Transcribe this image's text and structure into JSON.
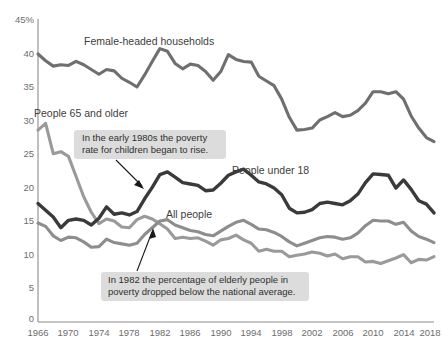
{
  "chart_data": {
    "type": "line",
    "title": "",
    "xlabel": "",
    "ylabel": "",
    "xlim": [
      1966,
      2018
    ],
    "ylim": [
      0,
      45
    ],
    "grid": false,
    "legend_position": "inline-labels",
    "y_tick_labels": [
      "45%",
      "40",
      "35",
      "30",
      "25",
      "20",
      "15",
      "10",
      "5",
      "0"
    ],
    "y_ticks": [
      45,
      40,
      35,
      30,
      25,
      20,
      15,
      10,
      5,
      0
    ],
    "x_tick_labels": [
      "1966",
      "1970",
      "1974",
      "1978",
      "1982",
      "1986",
      "1990",
      "1994",
      "1998",
      "2002",
      "2006",
      "2010",
      "2014",
      "2018"
    ],
    "x_ticks": [
      1966,
      1970,
      1974,
      1978,
      1982,
      1986,
      1990,
      1994,
      1998,
      2002,
      2006,
      2010,
      2014,
      2018
    ],
    "x": [
      1966,
      1967,
      1968,
      1969,
      1970,
      1971,
      1972,
      1973,
      1974,
      1975,
      1976,
      1977,
      1978,
      1979,
      1980,
      1981,
      1982,
      1983,
      1984,
      1985,
      1986,
      1987,
      1988,
      1989,
      1990,
      1991,
      1992,
      1993,
      1994,
      1995,
      1996,
      1997,
      1998,
      1999,
      2000,
      2001,
      2002,
      2003,
      2004,
      2005,
      2006,
      2007,
      2008,
      2009,
      2010,
      2011,
      2012,
      2013,
      2014,
      2015,
      2016,
      2017,
      2018
    ],
    "series": [
      {
        "name": "Female-headed households",
        "color": "#6f6f6f",
        "values": [
          39.8,
          38.8,
          38.0,
          38.2,
          38.1,
          38.7,
          38.2,
          37.5,
          36.8,
          37.5,
          37.3,
          36.2,
          35.6,
          34.9,
          36.7,
          38.7,
          40.6,
          40.2,
          38.4,
          37.6,
          38.3,
          38.1,
          37.2,
          35.9,
          37.2,
          39.7,
          39.0,
          38.7,
          38.6,
          36.5,
          35.8,
          35.1,
          33.1,
          30.4,
          28.5,
          28.6,
          28.8,
          30.0,
          30.5,
          31.1,
          30.5,
          30.7,
          31.4,
          32.5,
          34.2,
          34.2,
          33.9,
          34.2,
          33.1,
          30.6,
          28.8,
          27.4,
          26.8
        ]
      },
      {
        "name": "People 65 and older",
        "color": "#9a9a9a",
        "values": [
          28.5,
          29.5,
          25.0,
          25.3,
          24.6,
          21.6,
          18.6,
          16.3,
          14.6,
          15.3,
          15.0,
          14.1,
          14.0,
          15.2,
          15.7,
          15.3,
          14.6,
          13.8,
          12.4,
          12.6,
          12.4,
          12.5,
          12.0,
          11.4,
          12.2,
          12.4,
          12.9,
          12.2,
          11.7,
          10.5,
          10.8,
          10.5,
          10.5,
          9.7,
          9.9,
          10.1,
          10.4,
          10.2,
          9.8,
          10.1,
          9.4,
          9.7,
          9.7,
          8.9,
          9.0,
          8.7,
          9.1,
          9.5,
          10.0,
          8.8,
          9.3,
          9.2,
          9.7
        ]
      },
      {
        "name": "People under 18",
        "color": "#3a3a3a",
        "values": [
          17.6,
          16.6,
          15.6,
          14.0,
          15.1,
          15.3,
          15.1,
          14.4,
          15.4,
          17.1,
          16.0,
          16.2,
          15.9,
          16.4,
          18.3,
          20.0,
          21.9,
          22.3,
          21.5,
          20.7,
          20.5,
          20.3,
          19.5,
          19.6,
          20.6,
          21.8,
          22.3,
          22.7,
          21.8,
          20.8,
          20.5,
          19.9,
          18.9,
          16.9,
          16.2,
          16.3,
          16.7,
          17.6,
          17.8,
          17.6,
          17.4,
          18.0,
          19.0,
          20.7,
          22.0,
          21.9,
          21.8,
          19.9,
          21.1,
          19.7,
          18.0,
          17.5,
          16.2
        ]
      },
      {
        "name": "All people",
        "color": "#8d8d8d",
        "values": [
          14.7,
          14.2,
          12.8,
          12.1,
          12.6,
          12.5,
          11.9,
          11.1,
          11.2,
          12.3,
          11.8,
          11.6,
          11.4,
          11.7,
          13.0,
          14.0,
          15.0,
          15.2,
          14.4,
          14.0,
          13.6,
          13.4,
          13.0,
          12.8,
          13.5,
          14.2,
          14.8,
          15.1,
          14.5,
          13.8,
          13.7,
          13.3,
          12.7,
          11.9,
          11.3,
          11.7,
          12.1,
          12.5,
          12.7,
          12.6,
          12.3,
          12.5,
          13.2,
          14.3,
          15.1,
          15.0,
          15.0,
          14.5,
          14.8,
          13.5,
          12.7,
          12.3,
          11.8
        ]
      }
    ],
    "annotations": [
      {
        "id": "children-callout",
        "text_line1": "In the early 1980s the poverty",
        "text_line2": "rate for children began to rise.",
        "points_to_series": "People under 18",
        "points_to_year": 1982
      },
      {
        "id": "elderly-callout",
        "text_line1": "In 1982 the percentage of elderly people in",
        "text_line2": "poverty dropped below the national average.",
        "points_to_series": "People 65 and older",
        "points_to_year": 1982
      }
    ],
    "inline_labels": [
      {
        "text": "Female-headed households",
        "x": 84,
        "y": 45
      },
      {
        "text": "People 65 and older",
        "x": 34,
        "y": 117
      },
      {
        "text": "People under 18",
        "x": 232,
        "y": 174
      },
      {
        "text": "All people",
        "x": 166,
        "y": 218
      }
    ]
  },
  "colors": {
    "female_headed": "#6f6f6f",
    "elderly": "#9a9a9a",
    "under18": "#3a3a3a",
    "all_people": "#8d8d8d",
    "axis": "#8c8c8c",
    "callout_bg": "#dcdcdc",
    "background": "#ffffff"
  }
}
